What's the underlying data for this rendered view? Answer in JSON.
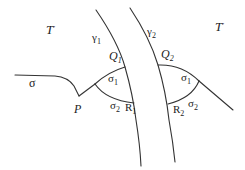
{
  "diagram": {
    "regions": [
      {
        "id": "T-left",
        "label": "T",
        "mark": "'"
      },
      {
        "id": "T-right",
        "label": "T",
        "mark": "'"
      }
    ],
    "curves": [
      {
        "id": "gamma1",
        "label": "γ",
        "sub": "1"
      },
      {
        "id": "gamma2",
        "label": "γ",
        "sub": "2"
      },
      {
        "id": "sigma",
        "label": "σ"
      }
    ],
    "points": [
      {
        "id": "P",
        "label": "P"
      },
      {
        "id": "Q1",
        "label": "Q",
        "sub": "1"
      },
      {
        "id": "Q2",
        "label": "Q",
        "sub": "2"
      },
      {
        "id": "R1",
        "label": "R",
        "sub": "1"
      },
      {
        "id": "R2",
        "label": "R",
        "sub": "2"
      }
    ],
    "arc_labels": [
      {
        "id": "left-sigma1",
        "label": "σ",
        "sub": "1"
      },
      {
        "id": "left-sigma2",
        "label": "σ",
        "sub": "2"
      },
      {
        "id": "right-sigma1",
        "label": "σ",
        "sub": "1"
      },
      {
        "id": "right-sigma2",
        "label": "σ",
        "sub": "2"
      }
    ],
    "stroke_color": "#333333",
    "background_color": "#ffffff"
  }
}
